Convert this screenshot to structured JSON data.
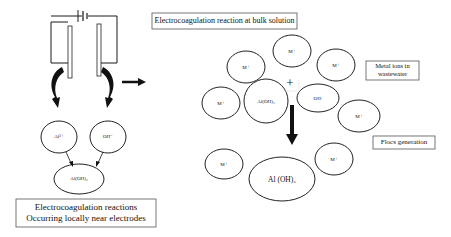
{
  "left_section": {
    "caption_line1": "Electrocoagulation reactions",
    "caption_line2": "Occurring locally near electrodes",
    "nodes": [
      {
        "id": "al-ion",
        "label": "Al³⁺"
      },
      {
        "id": "oh-ion",
        "label": "OH⁻"
      },
      {
        "id": "al-oh3",
        "label": "Al(OH)₃"
      }
    ]
  },
  "right_section": {
    "title": "Electrocoagulation reaction at bulk solution",
    "metal_ions_label": "Metal ions in wastewater",
    "metal_ions_line1": "Metal ions in",
    "metal_ions_line2": "wastewater",
    "flocs_label": "Flocs generation",
    "plus_sign": "+",
    "nodes": [
      {
        "id": "m1",
        "label": "M⁺"
      },
      {
        "id": "m2",
        "label": "M⁺"
      },
      {
        "id": "m3",
        "label": "M⁺"
      },
      {
        "id": "m4",
        "label": "M⁺"
      },
      {
        "id": "aloh3-small",
        "label": "Al(OH)₃"
      },
      {
        "id": "oh",
        "label": "OH-"
      },
      {
        "id": "m5",
        "label": "M⁺"
      },
      {
        "id": "m6",
        "label": "M⁺"
      },
      {
        "id": "m7",
        "label": "M⁺"
      },
      {
        "id": "floc",
        "label": "Al (OH)₃"
      }
    ]
  },
  "colors": {
    "line": "#1a1a1a",
    "box_border": "#555555",
    "background": "#ffffff"
  }
}
